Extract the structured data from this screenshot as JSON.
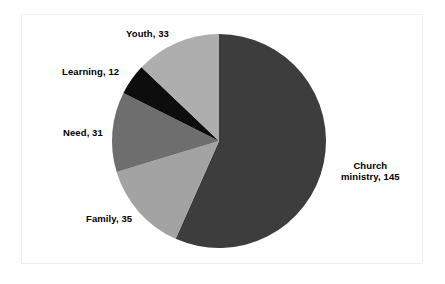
{
  "chart_data": {
    "type": "pie",
    "title": "",
    "subtitle": "",
    "xlabel": "",
    "ylabel": "",
    "legend_position": "none",
    "grid": false,
    "total": 256,
    "start_angle_deg": 0,
    "direction": "clockwise",
    "categories": [
      "Church ministry",
      "Family",
      "Need",
      "Learning",
      "Youth"
    ],
    "values": [
      145,
      35,
      31,
      12,
      33
    ],
    "slices": [
      {
        "name": "Church ministry",
        "value": 145,
        "label": "Church",
        "label_line2": "ministry, 145",
        "color": "#3d3d3d",
        "percent": 56.6
      },
      {
        "name": "Family",
        "value": 35,
        "label": "Family, 35",
        "color": "#a3a3a3",
        "percent": 13.7
      },
      {
        "name": "Need",
        "value": 31,
        "label": "Need, 31",
        "color": "#6e6e6e",
        "percent": 12.1
      },
      {
        "name": "Learning",
        "value": 12,
        "label": "Learning, 12",
        "color": "#0d0d0d",
        "percent": 4.7
      },
      {
        "name": "Youth",
        "value": 33,
        "label": "Youth, 33",
        "color": "#aeaeae",
        "percent": 12.9
      }
    ]
  },
  "colors": {
    "background": "#ffffff",
    "frame_border": "#eceef0",
    "label_text": "#000000"
  },
  "geometry": {
    "center_x": 219,
    "center_y": 141,
    "radius": 107
  }
}
